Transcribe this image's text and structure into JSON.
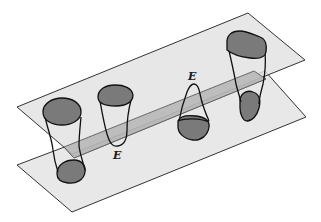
{
  "figure": {
    "colors": {
      "plane_fill": "#e6e6e6",
      "plane_stroke": "#333333",
      "strip_fill": "#b9b9b9",
      "disk_fill": "#7a7a7a",
      "outline": "#111111",
      "background": "#ffffff"
    },
    "planes": [
      {
        "name": "upper-plane",
        "points": "17,107 248,13 305,60 72,154"
      },
      {
        "name": "lower-plane",
        "points": "17,165 265,71 306,117 72,212"
      }
    ],
    "strip": {
      "name": "connecting-strip",
      "points": "64,147 254,71 266,79 74,158"
    },
    "tubes": [
      {
        "id": 1,
        "label": "",
        "has_top_disk": true,
        "has_bottom_disk": true
      },
      {
        "id": 2,
        "label": "E",
        "has_top_disk": true,
        "has_bottom_disk": false
      },
      {
        "id": 3,
        "label": "E",
        "has_top_disk": false,
        "has_bottom_disk": true
      },
      {
        "id": 4,
        "label": "",
        "has_top_disk": true,
        "has_bottom_disk": true
      }
    ],
    "labels": [
      {
        "text": "E",
        "x": 113,
        "y": 159,
        "name": "label-e-lower"
      },
      {
        "text": "E",
        "x": 188,
        "y": 80,
        "name": "label-e-upper"
      }
    ]
  }
}
